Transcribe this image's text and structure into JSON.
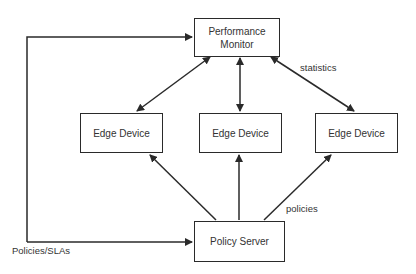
{
  "nodes": {
    "monitor": {
      "line1": "Performance",
      "line2": "Monitor"
    },
    "edge1": {
      "label": "Edge Device"
    },
    "edge2": {
      "label": "Edge Device"
    },
    "edge3": {
      "label": "Edge Device"
    },
    "server": {
      "label": "Policy Server"
    }
  },
  "edge_labels": {
    "statistics": "statistics",
    "policies": "policies",
    "policies_slas": "Policies/SLAs"
  },
  "colors": {
    "stroke": "#2a2a2a",
    "background": "#ffffff"
  }
}
